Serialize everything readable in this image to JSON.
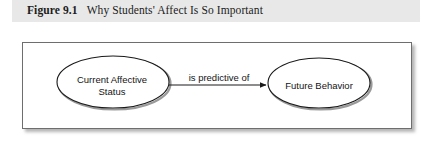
{
  "figure": {
    "label": "Figure 9.1",
    "title": "Why Students' Affect Is So Important",
    "caption_full": "Figure 9.1   Why Students' Affect Is So Important"
  },
  "diagram": {
    "type": "flow",
    "nodes": [
      {
        "id": "source",
        "shape": "ellipse",
        "label_line1": "Current Affective",
        "label_line2": "Status",
        "label": "Current Affective Status"
      },
      {
        "id": "target",
        "shape": "ellipse",
        "label_line1": "Future Behavior",
        "label": "Future Behavior"
      }
    ],
    "edges": [
      {
        "from": "source",
        "to": "target",
        "label": "is predictive of",
        "arrowhead": "filled-triangle"
      }
    ]
  },
  "colors": {
    "caption_band": "#e8e8e8",
    "frame_border": "#6e6e6e",
    "node_stroke": "#1a1a1a",
    "node_fill": "#ffffff",
    "text": "#141414",
    "shadow": "#8c8c8c"
  }
}
